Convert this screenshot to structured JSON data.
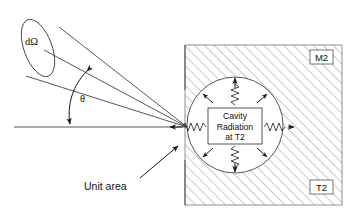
{
  "figure": {
    "labels": {
      "solid_angle": "dΩ",
      "theta": "θ",
      "unit_area": "Unit area",
      "center_line1": "Cavity",
      "center_line2": "Radiation",
      "center_line3": "at T2",
      "block_tag_top": "M2",
      "block_tag_bottom": "T2"
    },
    "colors": {
      "line": "#2b2b2b",
      "hatch": "#555555",
      "background": "#ffffff",
      "block_outline": "#777777"
    },
    "geometry": {
      "canvas_width": 354,
      "canvas_height": 215,
      "block_x": 185,
      "block_y": 45,
      "block_width": 157,
      "block_height": 160,
      "cavity_center_x": 235,
      "cavity_center_y": 125,
      "cavity_radius": 48,
      "aperture_x": 187,
      "aperture_y": 127,
      "cone_far_center_x": 38,
      "cone_far_center_y": 48,
      "cone_far_rx": 14,
      "cone_far_ry": 30,
      "theta_degrees": 28
    },
    "radiation_arrow_count": 8
  }
}
